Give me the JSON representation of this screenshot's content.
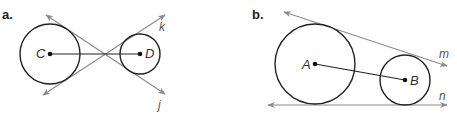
{
  "colors": {
    "circle_stroke": "#222222",
    "tangent_stroke": "#8a8a8a",
    "background": "#ffffff"
  },
  "diagram_a": {
    "part_label": "a.",
    "circles": [
      {
        "name": "C",
        "cx": 50,
        "cy": 54,
        "r": 30,
        "label": "C"
      },
      {
        "name": "D",
        "cx": 140,
        "cy": 54,
        "r": 20,
        "label": "D"
      }
    ],
    "segment": {
      "from": "C",
      "to": "D"
    },
    "tangent_lines": [
      {
        "name": "j",
        "label": "j",
        "type": "common internal tangent"
      },
      {
        "name": "k",
        "label": "k",
        "type": "common internal tangent"
      }
    ]
  },
  "diagram_b": {
    "part_label": "b.",
    "circles": [
      {
        "name": "A",
        "cx": 315,
        "cy": 64,
        "r": 40,
        "label": "A"
      },
      {
        "name": "B",
        "cx": 405,
        "cy": 80,
        "r": 25,
        "label": "B"
      }
    ],
    "segment": {
      "from": "A",
      "to": "B"
    },
    "tangent_lines": [
      {
        "name": "m",
        "label": "m",
        "type": "common external tangent"
      },
      {
        "name": "n",
        "label": "n",
        "type": "common external tangent"
      }
    ]
  }
}
